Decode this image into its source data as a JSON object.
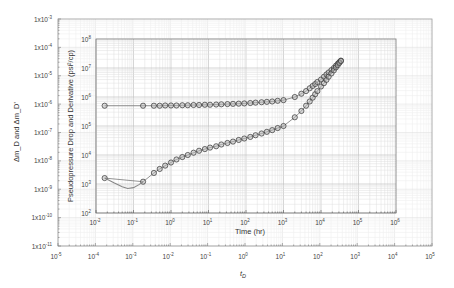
{
  "chart_data": [
    {
      "type": "line",
      "title": "",
      "role": "outer-dimensionless-axes",
      "xlabel": "t_D",
      "ylabel": "Δm_D and Δm_D'",
      "xscale": "log",
      "yscale": "log",
      "xlim": [
        1e-05,
        100000.0
      ],
      "ylim": [
        1e-11,
        0.001
      ],
      "x_ticks": [
        "10^-5",
        "10^-4",
        "10^-3",
        "10^-2",
        "10^-1",
        "10^0",
        "10^1",
        "10^2",
        "10^3",
        "10^4",
        "10^5"
      ],
      "y_ticks": [
        "1x10^-3",
        "1x10^-4",
        "1x10^-5",
        "1x10^-6",
        "1x10^-7",
        "1x10^-8",
        "1x10^-9",
        "1x10^-10",
        "1x10^-11"
      ],
      "grid": true
    },
    {
      "type": "scatter",
      "title": "",
      "role": "inner-field-data",
      "xlabel": "Time (hr)",
      "ylabel": "Pseudopressure Drop and Derivative (psi²/cp)",
      "xscale": "log",
      "yscale": "log",
      "xlim": [
        0.01,
        1000000.0
      ],
      "ylim": [
        100.0,
        100000000.0
      ],
      "x_ticks": [
        "10^-2",
        "10^-1",
        "10^0",
        "10^1",
        "10^2",
        "10^3",
        "10^4",
        "10^5",
        "10^6"
      ],
      "y_ticks": [
        "10^2",
        "10^3",
        "10^4",
        "10^5",
        "10^6",
        "10^7",
        "10^8"
      ],
      "grid": true,
      "series": [
        {
          "name": "Pseudopressure Drop",
          "marker": "circle",
          "x": [
            0.017,
            0.18,
            0.35,
            0.5,
            0.7,
            1,
            1.4,
            2,
            2.8,
            4,
            5.6,
            8,
            11,
            16,
            22,
            32,
            45,
            64,
            90,
            130,
            180,
            260,
            360,
            500,
            700,
            1000,
            2000,
            3000,
            4000,
            5000,
            6000,
            7000,
            8000,
            10000,
            12000,
            14000,
            16000,
            19000,
            22000,
            25000,
            28000,
            31000,
            34000
          ],
          "y": [
            500000,
            500000,
            500000,
            500000,
            510000,
            510000,
            510000,
            520000,
            520000,
            530000,
            530000,
            540000,
            540000,
            550000,
            560000,
            570000,
            580000,
            590000,
            600000,
            620000,
            640000,
            660000,
            680000,
            700000,
            740000,
            780000,
            1000000,
            1300000,
            1600000,
            2000000,
            2400000,
            2800000,
            3300000,
            4000000,
            5000000,
            6000000,
            7000000,
            8500000,
            10000000,
            12000000,
            14000000,
            16000000,
            18000000
          ]
        },
        {
          "name": "Pseudopressure Derivative",
          "marker": "circle",
          "x": [
            0.017,
            0.18,
            0.35,
            0.5,
            0.7,
            1,
            1.4,
            2,
            2.8,
            4,
            5.6,
            8,
            11,
            16,
            22,
            32,
            45,
            64,
            90,
            130,
            180,
            260,
            360,
            500,
            700,
            1000,
            2000,
            3000,
            4000,
            5000,
            6000,
            7000,
            8000,
            10000,
            12000,
            14000,
            16000,
            19000,
            22000,
            25000,
            28000,
            31000,
            34000
          ],
          "y": [
            1600,
            1200,
            2400,
            3300,
            4300,
            5500,
            7000,
            8500,
            10000,
            12000,
            14000,
            16000,
            18000,
            20000,
            23000,
            26000,
            29000,
            33000,
            37000,
            42000,
            48000,
            55000,
            63000,
            72000,
            85000,
            100000,
            200000,
            330000,
            500000,
            700000,
            950000,
            1250000,
            1600000,
            2300000,
            3000000,
            3900000,
            5000000,
            6500000,
            8300000,
            10500000,
            12500000,
            15000000,
            17500000
          ]
        },
        {
          "name": "Early derivative (line, no markers)",
          "x": [
            0.017,
            0.03,
            0.05,
            0.07,
            0.1,
            0.14,
            0.18
          ],
          "y": [
            1600,
            1100,
            800,
            700,
            750,
            950,
            1200
          ]
        }
      ]
    }
  ],
  "labels": {
    "outer_xlabel": "t",
    "outer_xlabel_sub": "D",
    "outer_ylabel": "Δm_D and Δm_D'",
    "inner_xlabel": "Time (hr)",
    "inner_ylabel": "Pseudopressure Drop and Derivative (psi²/cp)"
  },
  "colors": {
    "marker_stroke": "#333333",
    "marker_fill": "#b5b5b5",
    "line": "#666666",
    "early_curve": "#888888",
    "grid_minor": "#e2e2e2",
    "grid_major": "#c8c8c8",
    "frame": "#888888"
  }
}
